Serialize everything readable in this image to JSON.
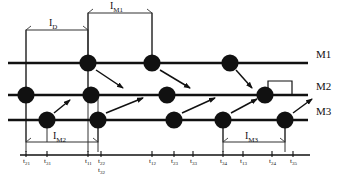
{
  "diagram": {
    "machines": [
      {
        "id": "M1",
        "label": "M1",
        "y": 63
      },
      {
        "id": "M2",
        "label": "M2",
        "y": 95
      },
      {
        "id": "M3",
        "label": "M3",
        "y": 120
      }
    ],
    "nodes": [
      {
        "id": "n-m1-1",
        "machine": "M1",
        "x": 88,
        "y": 63
      },
      {
        "id": "n-m1-2",
        "machine": "M1",
        "x": 152,
        "y": 63
      },
      {
        "id": "n-m1-3",
        "machine": "M1",
        "x": 230,
        "y": 63
      },
      {
        "id": "n-m2-1",
        "machine": "M2",
        "x": 26,
        "y": 95
      },
      {
        "id": "n-m2-2",
        "machine": "M2",
        "x": 91,
        "y": 95
      },
      {
        "id": "n-m2-3",
        "machine": "M2",
        "x": 167,
        "y": 95
      },
      {
        "id": "n-m2-4",
        "machine": "M2",
        "x": 265,
        "y": 95
      },
      {
        "id": "n-m3-1",
        "machine": "M3",
        "x": 47,
        "y": 120
      },
      {
        "id": "n-m3-2",
        "machine": "M3",
        "x": 98,
        "y": 120
      },
      {
        "id": "n-m3-3",
        "machine": "M3",
        "x": 174,
        "y": 120
      },
      {
        "id": "n-m3-4",
        "machine": "M3",
        "x": 223,
        "y": 120
      },
      {
        "id": "n-m3-5",
        "machine": "M3",
        "x": 285,
        "y": 120
      }
    ],
    "arrows": [
      {
        "id": "a1",
        "from": "n-m1-1",
        "to": "n-m2-3",
        "x1": 96,
        "y1": 70,
        "x2": 123,
        "y2": 88
      },
      {
        "id": "a2",
        "from": "n-m1-2",
        "to": "n-m2-3",
        "x1": 160,
        "y1": 70,
        "x2": 190,
        "y2": 88
      },
      {
        "id": "a3",
        "from": "n-m1-3",
        "to": "n-m2-4",
        "x1": 236,
        "y1": 70,
        "x2": 252,
        "y2": 88
      },
      {
        "id": "a4",
        "from": "n-m3-1",
        "to": "n-m2-1",
        "x1": 54,
        "y1": 113,
        "x2": 70,
        "y2": 100
      },
      {
        "id": "a5",
        "from": "n-m3-2",
        "to": "n-m2-3",
        "x1": 106,
        "y1": 113,
        "x2": 143,
        "y2": 98
      },
      {
        "id": "a6",
        "from": "n-m3-3",
        "to": "n-m2-4",
        "x1": 182,
        "y1": 113,
        "x2": 215,
        "y2": 98
      },
      {
        "id": "a7",
        "from": "n-m3-4",
        "to": "n-m2-4",
        "x1": 231,
        "y1": 113,
        "x2": 257,
        "y2": 99
      },
      {
        "id": "a8",
        "from": "n-m3-5",
        "to": "exit",
        "x1": 293,
        "y1": 113,
        "x2": 312,
        "y2": 99
      }
    ],
    "intervals": [
      {
        "id": "ID",
        "label": "I",
        "subscript": "D",
        "x1": 26,
        "x2": 88,
        "bracket_y": 30,
        "label_x": 49,
        "label_y": 26,
        "drop_left": 95,
        "drop_right": 95
      },
      {
        "id": "IM1",
        "label": "I",
        "subscript": "M1",
        "x1": 88,
        "x2": 152,
        "bracket_y": 13,
        "label_x": 110,
        "label_y": 9,
        "drop_left": 63,
        "drop_right": 63
      },
      {
        "id": "IM2",
        "label": "I",
        "subscript": "M2",
        "x1": 26,
        "x2": 98,
        "bracket_y": 142,
        "label_x": 53,
        "label_y": 139,
        "drop_left": 95,
        "drop_right": 120
      },
      {
        "id": "IM3",
        "label": "I",
        "subscript": "M3",
        "x1": 223,
        "x2": 285,
        "bracket_y": 142,
        "label_x": 245,
        "label_y": 139,
        "drop_left": 120,
        "drop_right": 120
      }
    ],
    "axis": {
      "y": 155,
      "x_start": 20,
      "x_end": 310
    },
    "ticks": [
      {
        "id": "t21",
        "base": "t",
        "sub": "21",
        "x": 26,
        "row": 0
      },
      {
        "id": "t31",
        "base": "t",
        "sub": "31",
        "x": 47,
        "row": 0
      },
      {
        "id": "t11",
        "base": "t",
        "sub": "11",
        "x": 88,
        "row": 0
      },
      {
        "id": "t22",
        "base": "t",
        "sub": "22",
        "x": 101,
        "row": 0
      },
      {
        "id": "t32",
        "base": "t",
        "sub": "32",
        "x": 101,
        "row": 1
      },
      {
        "id": "t12",
        "base": "t",
        "sub": "12",
        "x": 152,
        "row": 0
      },
      {
        "id": "t23",
        "base": "t",
        "sub": "23",
        "x": 174,
        "row": 0
      },
      {
        "id": "t33",
        "base": "t",
        "sub": "33",
        "x": 193,
        "row": 0
      },
      {
        "id": "t34",
        "base": "t",
        "sub": "34",
        "x": 223,
        "row": 0
      },
      {
        "id": "t13",
        "base": "t",
        "sub": "13",
        "x": 243,
        "row": 0
      },
      {
        "id": "t24",
        "base": "t",
        "sub": "24",
        "x": 272,
        "row": 0
      },
      {
        "id": "t35",
        "base": "t",
        "sub": "35",
        "x": 293,
        "row": 0
      }
    ],
    "idle_box": {
      "id": "idle-m2",
      "x": 268,
      "y": 81,
      "width": 24,
      "height": 14
    },
    "colors": {
      "line": "#111111",
      "node": "#111111",
      "background": "#ffffff",
      "bracket": "#333333"
    }
  }
}
